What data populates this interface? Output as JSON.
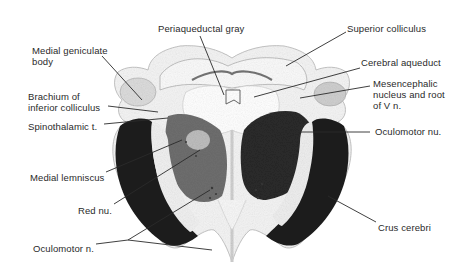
{
  "figure": {
    "background": "#ffffff",
    "tissue_colors": {
      "pale": "#f3f3f3",
      "mid": "#8a8a8a",
      "dark": "#1e1e1e",
      "line": "#2a2a2a"
    }
  },
  "labels": {
    "medial_geniculate_body": "Medial geniculate\nbody",
    "brachium_inferior_colliculus": "Brachium of\ninferior colliculus",
    "spinothalamic_tract": "Spinothalamic t.",
    "medial_lemniscus": "Medial lemniscus",
    "red_nucleus": "Red nu.",
    "oculomotor_nerve": "Oculomotor n.",
    "periaqueductal_gray": "Periaqueductal gray",
    "superior_colliculus": "Superior colliculus",
    "cerebral_aqueduct": "Cerebral aqueduct",
    "mesencephalic_nucleus": "Mesencephalic\nnucleus and root\nof V n.",
    "oculomotor_nucleus": "Oculomotor nu.",
    "crus_cerebri": "Crus cerebri"
  }
}
